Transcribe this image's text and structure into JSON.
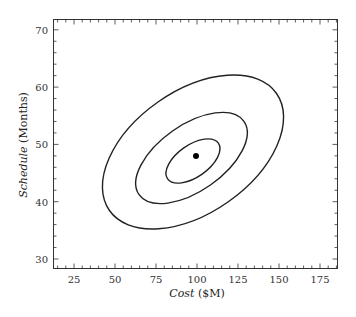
{
  "chart_data": {
    "type": "contour",
    "title": "",
    "xlabel": "Cost ($M)",
    "xlabel_italic": "Cost",
    "xlabel_unit": "($M)",
    "ylabel": "Schedule (Months)",
    "ylabel_italic": "Schedule",
    "ylabel_unit": "(Months)",
    "xlim": [
      12.2,
      185.4
    ],
    "ylim": [
      28.4,
      71.7
    ],
    "x_ticks": [
      25,
      50,
      75,
      100,
      125,
      150,
      175
    ],
    "y_ticks": [
      30,
      40,
      50,
      60,
      70
    ],
    "x_minor_step": 5,
    "y_minor_step": 2,
    "grid": false,
    "legend": null,
    "center_point": {
      "x": 100,
      "y": 48
    },
    "contours": [
      {
        "name": "inner",
        "approx_extent": {
          "cost": [
            81,
            114
          ],
          "schedule": [
            43.3,
            50.9
          ]
        }
      },
      {
        "name": "middle",
        "approx_extent": {
          "cost": [
            62,
            131
          ],
          "schedule": [
            39.8,
            55.5
          ]
        }
      },
      {
        "name": "outer",
        "approx_extent": {
          "cost": [
            42,
            153
          ],
          "schedule": [
            35.2,
            62.1
          ]
        }
      }
    ],
    "colors": {
      "line": "#222222",
      "frame": "#333333",
      "point": "#000000"
    }
  }
}
